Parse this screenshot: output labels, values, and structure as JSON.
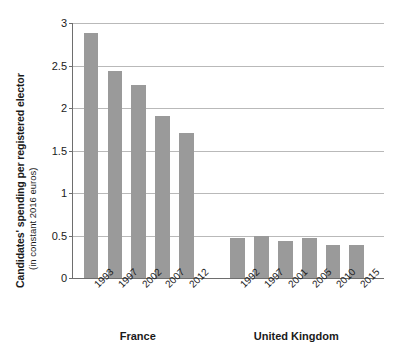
{
  "chart_data": {
    "type": "bar",
    "title": "",
    "xlabel": "",
    "ylabel": "Candidates' spending per registered elector",
    "ylabel_sub": "(in constant 2016 euros)",
    "ylim": [
      0,
      3
    ],
    "ytick_labels": [
      "0",
      "0.5",
      "1",
      "1.5",
      "2",
      "2.5",
      "3"
    ],
    "ytick_values": [
      0,
      0.5,
      1,
      1.5,
      2,
      2.5,
      3
    ],
    "grid": "horizontal",
    "legend": "none",
    "bar_color": "#9a9a9a",
    "axis_color": "#6e6e6e",
    "grid_color": "#b9b9b9",
    "groups": [
      {
        "name": "France",
        "categories": [
          "1993",
          "1997",
          "2002",
          "2007",
          "2012"
        ],
        "values": [
          2.88,
          2.44,
          2.27,
          1.91,
          1.71
        ]
      },
      {
        "name": "United Kingdom",
        "categories": [
          "1992",
          "1997",
          "2001",
          "2005",
          "2010",
          "2015"
        ],
        "values": [
          0.47,
          0.5,
          0.44,
          0.47,
          0.39,
          0.39
        ]
      }
    ]
  }
}
